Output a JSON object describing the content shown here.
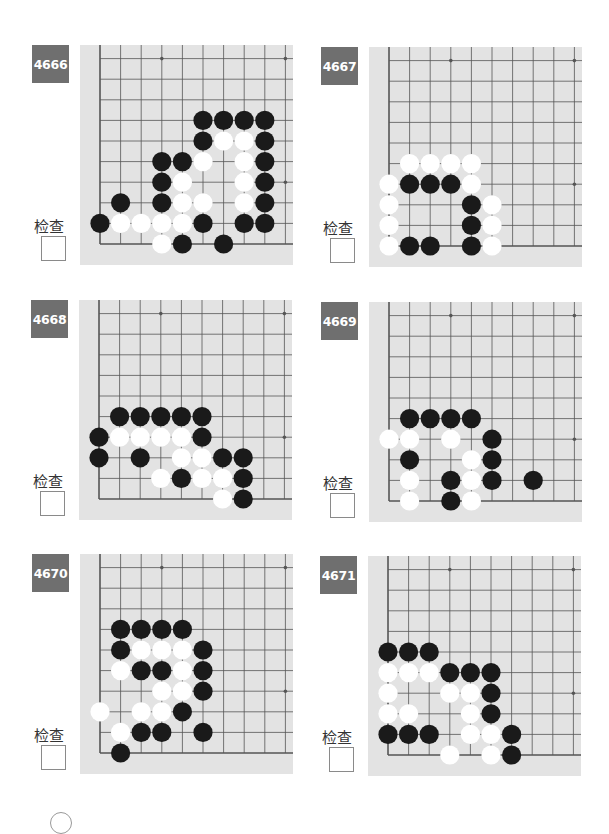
{
  "check_label": "检查",
  "colors": {
    "badge_bg": "#6f6f6f",
    "board_bg": "#e3e3e3",
    "grid_line": "#555555",
    "black_stone": "#1a1a1a",
    "white_stone": "#ffffff"
  },
  "grid": {
    "cols": 10,
    "rows": 10,
    "spacing": 20.6,
    "origin_x": 20,
    "origin_y": 199
  },
  "star_points": [
    [
      3,
      9
    ],
    [
      9,
      9
    ],
    [
      9,
      3
    ],
    [
      3,
      3
    ]
  ],
  "problems": [
    {
      "number": "4666",
      "black": [
        [
          5,
          6
        ],
        [
          6,
          6
        ],
        [
          7,
          6
        ],
        [
          8,
          6
        ],
        [
          5,
          5
        ],
        [
          8,
          5
        ],
        [
          3,
          4
        ],
        [
          4,
          4
        ],
        [
          8,
          4
        ],
        [
          3,
          3
        ],
        [
          8,
          3
        ],
        [
          1,
          2
        ],
        [
          3,
          2
        ],
        [
          8,
          2
        ],
        [
          0,
          1
        ],
        [
          5,
          1
        ],
        [
          7,
          1
        ],
        [
          8,
          1
        ],
        [
          4,
          0
        ],
        [
          6,
          0
        ]
      ],
      "white": [
        [
          6,
          5
        ],
        [
          7,
          5
        ],
        [
          5,
          4
        ],
        [
          7,
          4
        ],
        [
          4,
          3
        ],
        [
          7,
          3
        ],
        [
          4,
          2
        ],
        [
          5,
          2
        ],
        [
          7,
          2
        ],
        [
          1,
          1
        ],
        [
          2,
          1
        ],
        [
          3,
          1
        ],
        [
          4,
          1
        ],
        [
          3,
          0
        ]
      ]
    },
    {
      "number": "4667",
      "black": [
        [
          1,
          3
        ],
        [
          2,
          3
        ],
        [
          3,
          3
        ],
        [
          4,
          2
        ],
        [
          4,
          1
        ],
        [
          1,
          0
        ],
        [
          2,
          0
        ],
        [
          4,
          0
        ]
      ],
      "white": [
        [
          1,
          4
        ],
        [
          2,
          4
        ],
        [
          3,
          4
        ],
        [
          4,
          4
        ],
        [
          0,
          3
        ],
        [
          4,
          3
        ],
        [
          0,
          2
        ],
        [
          5,
          2
        ],
        [
          0,
          1
        ],
        [
          5,
          1
        ],
        [
          0,
          0
        ],
        [
          5,
          0
        ]
      ]
    },
    {
      "number": "4668",
      "black": [
        [
          1,
          4
        ],
        [
          2,
          4
        ],
        [
          3,
          4
        ],
        [
          4,
          4
        ],
        [
          5,
          4
        ],
        [
          0,
          3
        ],
        [
          5,
          3
        ],
        [
          0,
          2
        ],
        [
          2,
          2
        ],
        [
          6,
          2
        ],
        [
          7,
          2
        ],
        [
          4,
          1
        ],
        [
          7,
          1
        ],
        [
          7,
          0
        ]
      ],
      "white": [
        [
          1,
          3
        ],
        [
          2,
          3
        ],
        [
          3,
          3
        ],
        [
          4,
          3
        ],
        [
          4,
          2
        ],
        [
          5,
          2
        ],
        [
          3,
          1
        ],
        [
          5,
          1
        ],
        [
          6,
          1
        ],
        [
          6,
          0
        ]
      ]
    },
    {
      "number": "4669",
      "black": [
        [
          1,
          4
        ],
        [
          2,
          4
        ],
        [
          3,
          4
        ],
        [
          4,
          4
        ],
        [
          5,
          3
        ],
        [
          1,
          2
        ],
        [
          5,
          2
        ],
        [
          3,
          1
        ],
        [
          5,
          1
        ],
        [
          7,
          1
        ],
        [
          3,
          0
        ]
      ],
      "white": [
        [
          0,
          3
        ],
        [
          1,
          3
        ],
        [
          3,
          3
        ],
        [
          4,
          2
        ],
        [
          1,
          1
        ],
        [
          4,
          1
        ],
        [
          1,
          0
        ],
        [
          4,
          0
        ]
      ]
    },
    {
      "number": "4670",
      "black": [
        [
          1,
          6
        ],
        [
          2,
          6
        ],
        [
          3,
          6
        ],
        [
          4,
          6
        ],
        [
          1,
          5
        ],
        [
          5,
          5
        ],
        [
          2,
          4
        ],
        [
          3,
          4
        ],
        [
          5,
          4
        ],
        [
          5,
          3
        ],
        [
          4,
          2
        ],
        [
          2,
          1
        ],
        [
          3,
          1
        ],
        [
          5,
          1
        ],
        [
          1,
          0
        ]
      ],
      "white": [
        [
          2,
          5
        ],
        [
          3,
          5
        ],
        [
          4,
          5
        ],
        [
          1,
          4
        ],
        [
          4,
          4
        ],
        [
          3,
          3
        ],
        [
          4,
          3
        ],
        [
          0,
          2
        ],
        [
          2,
          2
        ],
        [
          3,
          2
        ],
        [
          1,
          1
        ]
      ]
    },
    {
      "number": "4671",
      "black": [
        [
          0,
          5
        ],
        [
          1,
          5
        ],
        [
          2,
          5
        ],
        [
          3,
          4
        ],
        [
          4,
          4
        ],
        [
          5,
          4
        ],
        [
          5,
          3
        ],
        [
          5,
          2
        ],
        [
          0,
          1
        ],
        [
          1,
          1
        ],
        [
          2,
          1
        ],
        [
          6,
          1
        ],
        [
          6,
          0
        ]
      ],
      "white": [
        [
          0,
          4
        ],
        [
          1,
          4
        ],
        [
          2,
          4
        ],
        [
          0,
          3
        ],
        [
          3,
          3
        ],
        [
          4,
          3
        ],
        [
          0,
          2
        ],
        [
          1,
          2
        ],
        [
          4,
          2
        ],
        [
          4,
          1
        ],
        [
          5,
          1
        ],
        [
          3,
          0
        ],
        [
          5,
          0
        ]
      ]
    }
  ]
}
